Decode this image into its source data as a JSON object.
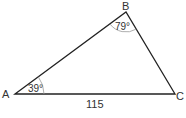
{
  "diagram": {
    "type": "triangle",
    "vertices": {
      "A": {
        "label": "A"
      },
      "B": {
        "label": "B"
      },
      "C": {
        "label": "C"
      }
    },
    "angles": {
      "A": "39°",
      "B": "79°"
    },
    "sides": {
      "AC": "115"
    },
    "colors": {
      "stroke": "#222222",
      "arc": "#888888",
      "text": "#333333"
    }
  }
}
